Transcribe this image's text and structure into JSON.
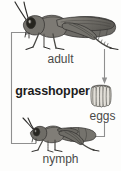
{
  "diagram": {
    "title": "grasshopper",
    "type": "life-cycle",
    "subject": "grasshopper",
    "background_color": "#fdfdfc",
    "line_color": "#8a8a8a",
    "text_color": "#4a4a48",
    "title_color": "#1c1c1c",
    "stages": [
      {
        "id": "adult",
        "label": "adult",
        "icon": "adult-grasshopper-icon",
        "position": "top"
      },
      {
        "id": "eggs",
        "label": "eggs",
        "icon": "egg-cluster-icon",
        "position": "right"
      },
      {
        "id": "nymph",
        "label": "nymph",
        "icon": "nymph-grasshopper-icon",
        "position": "bottom"
      }
    ],
    "arrows": [
      {
        "id": "adult-to-eggs",
        "from": "adult",
        "to": "eggs",
        "direction": "down"
      },
      {
        "id": "eggs-to-nymph",
        "from": "eggs",
        "to": "nymph",
        "direction": "left"
      },
      {
        "id": "nymph-to-adult",
        "from": "nymph",
        "to": "adult",
        "direction": "up-right"
      }
    ]
  }
}
